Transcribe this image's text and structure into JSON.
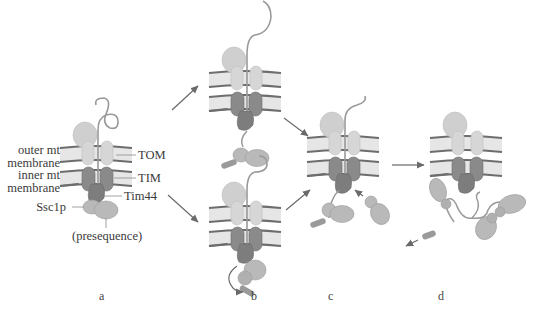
{
  "figure": {
    "labels": {
      "outer_membrane": [
        "outer mt",
        "membrane"
      ],
      "inner_membrane": [
        "inner mt",
        "membrane"
      ],
      "ssc1p": "Ssc1p",
      "presequence": "(presequence)",
      "tom": "TOM",
      "tim": "TIM",
      "tim44": "Tim44"
    },
    "panels": [
      {
        "id": "a",
        "letter": "a"
      },
      {
        "id": "b",
        "letter": "b"
      },
      {
        "id": "c",
        "letter": "c"
      },
      {
        "id": "d",
        "letter": "d"
      }
    ],
    "colors": {
      "membrane_fill": "#e6e6e6",
      "membrane_line": "#6d6d6d",
      "tom": "#d6d6d6",
      "tom_head": "#cfcfcf",
      "tim": "#8a8a8a",
      "tim44": "#7d7d7d",
      "ssc1p": "#b9b9b9",
      "chain": "#9a9a9a",
      "arrow": "#6a6a6a",
      "text": "#3a3a3a"
    }
  }
}
